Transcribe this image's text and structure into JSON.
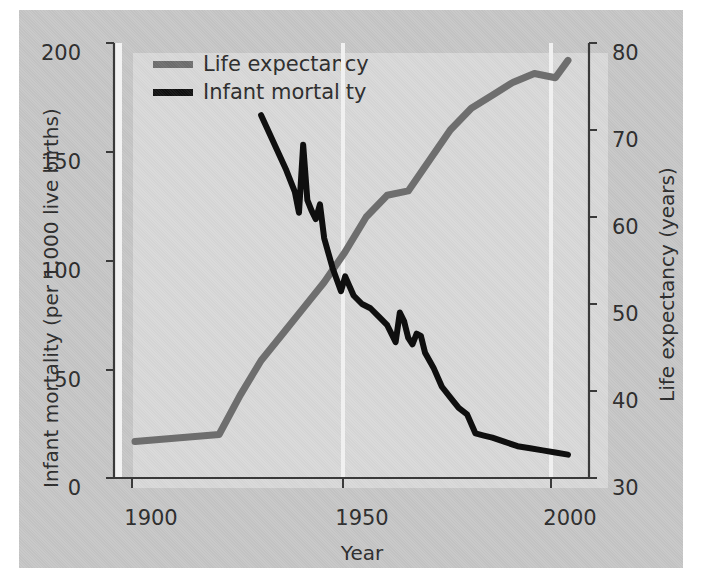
{
  "chart_data": {
    "type": "line",
    "title": "",
    "xlabel": "Year",
    "ylabel": "Infant mortality (per 1,000 live births)",
    "y2label": "Life expectancy (years)",
    "xlim": [
      1895,
      2008
    ],
    "ylim": [
      0,
      205
    ],
    "y2lim": [
      30,
      80
    ],
    "grid": false,
    "legend_position": "top-left-inside",
    "x_ticks": [
      "1900",
      "1950",
      "2000"
    ],
    "x_tick_values": [
      1900,
      1950,
      2000
    ],
    "y_ticks": [
      "0",
      "50",
      "100",
      "150",
      "200"
    ],
    "y_tick_values": [
      0,
      50,
      100,
      150,
      200
    ],
    "y2_ticks": [
      "30",
      "40",
      "50",
      "60",
      "70",
      "80"
    ],
    "y2_tick_values": [
      30,
      40,
      50,
      60,
      70,
      80
    ],
    "series": [
      {
        "name": "Life expectancy",
        "color": "#6e6e6e",
        "axis": "right",
        "units": "years",
        "x": [
          1900,
          1905,
          1910,
          1915,
          1920,
          1925,
          1930,
          1935,
          1940,
          1945,
          1950,
          1955,
          1960,
          1965,
          1970,
          1975,
          1980,
          1985,
          1990,
          1995,
          2000,
          2003
        ],
        "values": [
          34.2,
          34.4,
          34.6,
          34.8,
          35.0,
          39.5,
          43.5,
          46.5,
          49.5,
          52.5,
          56.0,
          60.0,
          62.5,
          63.0,
          66.5,
          70.0,
          72.5,
          74.0,
          75.5,
          76.5,
          76.0,
          78.0
        ]
      },
      {
        "name": "Infant mortality",
        "color": "#0f0f0f",
        "axis": "left",
        "units": "per 1,000 live births",
        "x": [
          1930,
          1933,
          1936,
          1938,
          1939,
          1940,
          1941,
          1942,
          1943,
          1944,
          1945,
          1947,
          1949,
          1950,
          1952,
          1954,
          1956,
          1958,
          1960,
          1962,
          1963,
          1964,
          1965,
          1966,
          1967,
          1968,
          1969,
          1971,
          1973,
          1975,
          1977,
          1979,
          1981,
          1983,
          1985,
          1988,
          1991,
          1994,
          1997,
          2000,
          2003
        ],
        "values": [
          171,
          158,
          145,
          135,
          125,
          157,
          131,
          126,
          122,
          129,
          113,
          99,
          88,
          95,
          86,
          82,
          80,
          76,
          72,
          64,
          78,
          74,
          66,
          63,
          68,
          67,
          59,
          52,
          43,
          38,
          33,
          30,
          21,
          20,
          19,
          17,
          15,
          14,
          13,
          12,
          11
        ]
      }
    ]
  },
  "legend": {
    "items": [
      {
        "label": "Life expectancy",
        "color": "#6e6e6e"
      },
      {
        "label": "Infant mortality",
        "color": "#0f0f0f"
      }
    ]
  },
  "axes": {
    "x_title": "Year",
    "y_left_title": "Infant mortality (per 1,000 live births)",
    "y_right_title": "Life expectancy (years)",
    "x_tick_labels": [
      "1900",
      "1950",
      "2000"
    ],
    "y_left_tick_labels": [
      "200",
      "150",
      "100",
      "50",
      "0"
    ],
    "y_right_tick_labels": [
      "80",
      "70",
      "60",
      "50",
      "40",
      "30"
    ]
  },
  "colors": {
    "panel_background": "#c6c6c6",
    "plot_background": "#d8d8d8",
    "axis": "#3a3a3a",
    "text": "#2b2b2b",
    "life_expectancy": "#6e6e6e",
    "infant_mortality": "#0f0f0f"
  }
}
